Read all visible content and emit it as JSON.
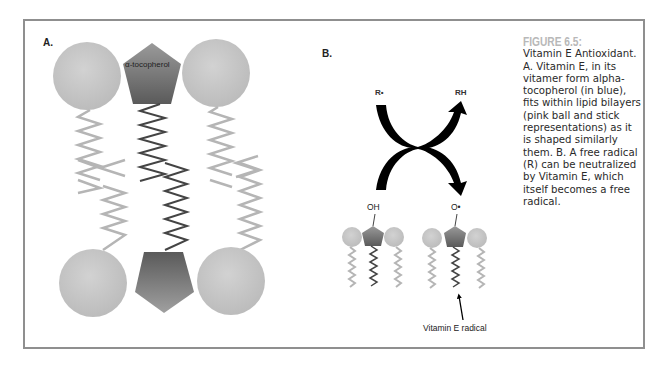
{
  "figure": {
    "panel_a_label": "A.",
    "panel_b_label": "B.",
    "alpha_tocopherol_label": "α-tocopherol",
    "reaction": {
      "reactant": "R•",
      "product": "RH",
      "vitamin_e_group": "OH",
      "radical_group": "O•",
      "radical_pointer_label": "Vitamin E radical"
    },
    "caption": {
      "title": "FIGURE 6.5:",
      "text": "Vitamin E Antioxidant. A. Vitamin E, in its vitamer form alpha-tocopherol (in blue), fits within lipid bilayers (pink ball and stick representations) as it is shaped similarly them. B. A free radical (R) can be neutralized by Vitamin E, which itself becomes a free radical."
    },
    "colors": {
      "frame": "#8f8f8f",
      "lipid_head": "#c4c4c4",
      "lipid_tail": "#b5b5b5",
      "tocopherol_dark": "#5e5e5e",
      "tocopherol_light": "#8a8a8a",
      "tocopherol_tail": "#444444",
      "arrow": "#000000",
      "caption_title": "#b8b8b8"
    }
  }
}
